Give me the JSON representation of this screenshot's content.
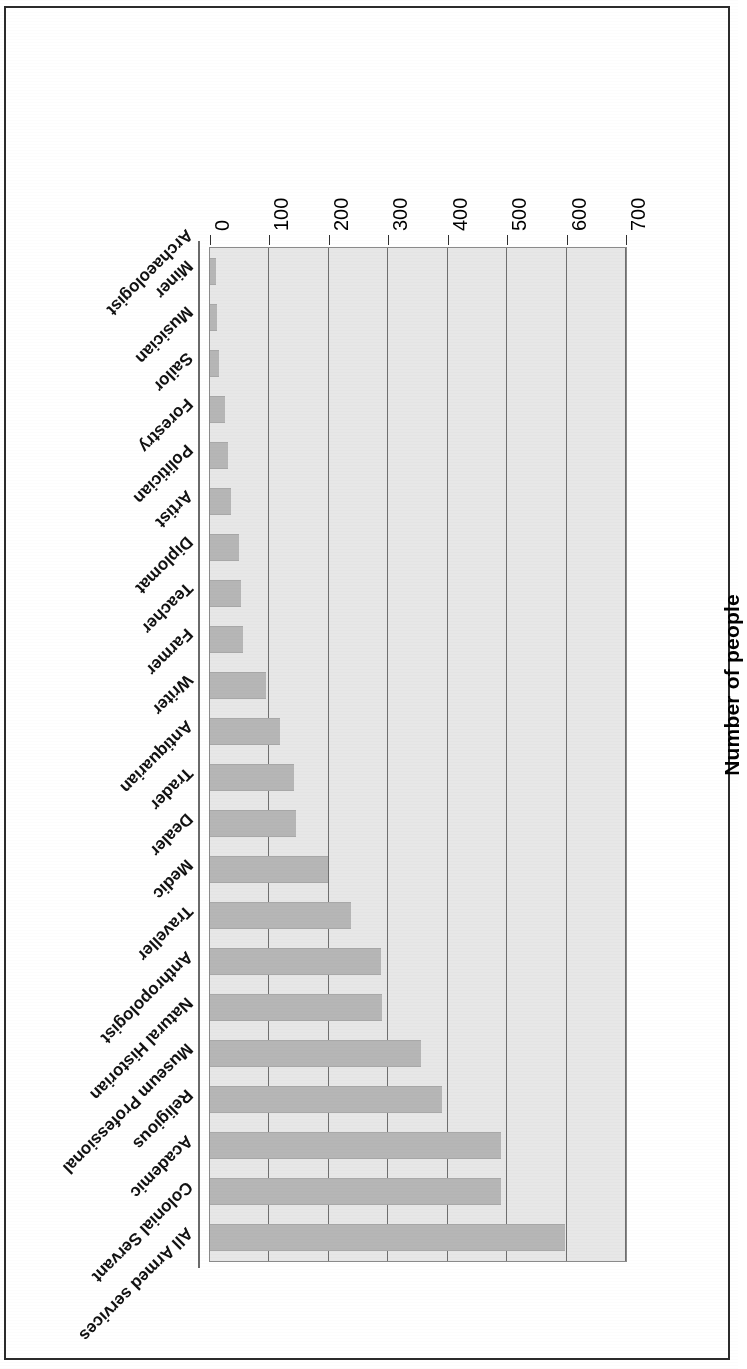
{
  "document": {
    "type": "scanned-page",
    "page_background": "#ffffff",
    "frame_color": "#2b2b2b",
    "orientation_note": "figure printed upside-down (rotated 180 degrees) on the page"
  },
  "chart_data": {
    "type": "bar",
    "orientation": "horizontal",
    "title": "",
    "xlabel": "",
    "ylabel": "Number of people",
    "value_axis_label": "Number of people",
    "ylim": [
      0,
      700
    ],
    "tick_labels": [
      "0",
      "100",
      "200",
      "300",
      "400",
      "500",
      "600",
      "700"
    ],
    "ticks": [
      0,
      100,
      200,
      300,
      400,
      500,
      600,
      700
    ],
    "grid": true,
    "legend": "none",
    "plot_background": "#e7e7e7",
    "bar_color": "#b6b6b6",
    "grid_color": "#6f6f6f",
    "axis_color": "#6a6a6a",
    "categories": [
      "All Armed services",
      "Colonial Servant",
      "Academic",
      "Religious",
      "Museum Professional",
      "Natural Historian",
      "Anthropologist",
      "Traveller",
      "Medic",
      "Dealer",
      "Trader",
      "Antiquarian",
      "Writer",
      "Farmer",
      "Teacher",
      "Diplomat",
      "Artist",
      "Politician",
      "Forestry",
      "Sailor",
      "Musician",
      "Miner"
    ],
    "values": [
      598,
      490,
      490,
      390,
      355,
      290,
      287,
      238,
      198,
      145,
      142,
      118,
      95,
      55,
      52,
      48,
      36,
      30,
      25,
      15,
      12,
      10
    ],
    "first_category_label": "Archaeologist"
  },
  "axis": {
    "title": "Number of people"
  }
}
